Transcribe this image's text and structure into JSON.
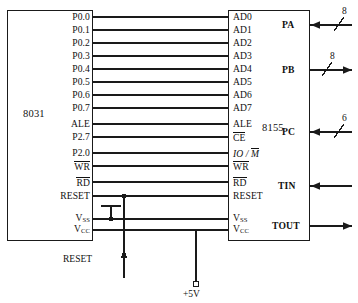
{
  "diagram": {
    "chips": [
      {
        "id": "u1",
        "name": "8031"
      },
      {
        "id": "u2",
        "name": "8155"
      }
    ],
    "left_pins": [
      "P0.0",
      "P0.1",
      "P0.2",
      "P0.3",
      "P0.4",
      "P0.5",
      "P0.6",
      "P0.7",
      "ALE",
      "P2.7",
      "P2.0",
      "WR",
      "RD",
      "RESET"
    ],
    "left_pins_overline": {
      "WR": true,
      "RD": true
    },
    "left_power_pins": [
      {
        "label": "V",
        "sub": "SS"
      },
      {
        "label": "V",
        "sub": "CC"
      }
    ],
    "right_pins": [
      "AD0",
      "AD1",
      "AD2",
      "AD3",
      "AD4",
      "AD5",
      "AD6",
      "AD7",
      "ALE",
      "CE",
      "IO / M",
      "WR",
      "RD",
      "RESET"
    ],
    "right_pins_overline": {
      "CE": true,
      "M": true,
      "WR": true,
      "RD": true
    },
    "right_power_pins": [
      {
        "label": "V",
        "sub": "SS"
      },
      {
        "label": "V",
        "sub": "CC"
      }
    ],
    "ports": [
      {
        "name": "PA",
        "bits": "8",
        "direction": "in",
        "bus": true
      },
      {
        "name": "PB",
        "bits": "8",
        "direction": "out",
        "bus": true
      },
      {
        "name": "PC",
        "bits": "6",
        "direction": "in",
        "bus": true
      },
      {
        "name": "TIN",
        "bits": "",
        "direction": "in",
        "bus": false
      },
      {
        "name": "TOUT",
        "bits": "",
        "direction": "out",
        "bus": false
      }
    ],
    "nets": [
      {
        "name": "RESET",
        "label": "RESET"
      },
      {
        "name": "supply",
        "label": "+5V"
      }
    ],
    "colors": {
      "wire": "#1a1a1a",
      "text": "#111111",
      "background": "#ffffff"
    }
  }
}
